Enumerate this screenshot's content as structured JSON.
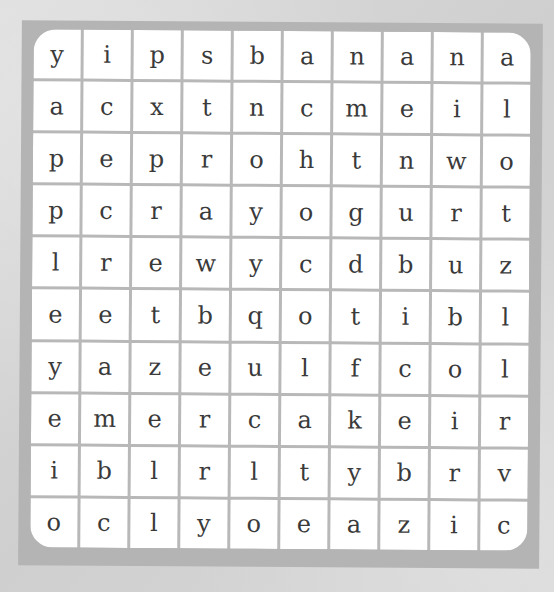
{
  "puzzle": {
    "type": "word-search",
    "rows": 10,
    "cols": 10,
    "grid": [
      [
        "y",
        "i",
        "p",
        "s",
        "b",
        "a",
        "n",
        "a",
        "n",
        "a"
      ],
      [
        "a",
        "c",
        "x",
        "t",
        "n",
        "c",
        "m",
        "e",
        "i",
        "l"
      ],
      [
        "p",
        "e",
        "p",
        "r",
        "o",
        "h",
        "t",
        "n",
        "w",
        "o"
      ],
      [
        "p",
        "c",
        "r",
        "a",
        "y",
        "o",
        "g",
        "u",
        "r",
        "t"
      ],
      [
        "l",
        "r",
        "e",
        "w",
        "y",
        "c",
        "d",
        "b",
        "u",
        "z"
      ],
      [
        "e",
        "e",
        "t",
        "b",
        "q",
        "o",
        "t",
        "i",
        "b",
        "l"
      ],
      [
        "y",
        "a",
        "z",
        "e",
        "u",
        "l",
        "f",
        "c",
        "o",
        "l"
      ],
      [
        "e",
        "m",
        "e",
        "r",
        "c",
        "a",
        "k",
        "e",
        "i",
        "r"
      ],
      [
        "i",
        "b",
        "l",
        "r",
        "l",
        "t",
        "y",
        "b",
        "r",
        "v"
      ],
      [
        "o",
        "c",
        "l",
        "y",
        "o",
        "e",
        "a",
        "z",
        "i",
        "c"
      ]
    ]
  },
  "colors": {
    "background": "#d6d6d6",
    "board_border": "#b4b4b4",
    "cell": "#ffffff",
    "letter": "#3a3a3a"
  }
}
